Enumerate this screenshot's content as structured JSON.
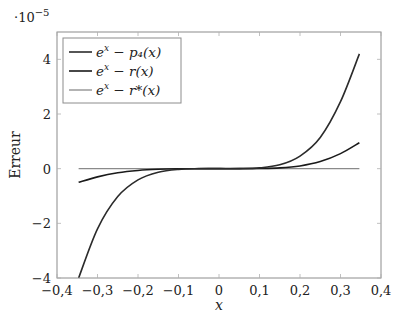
{
  "chart_data": {
    "type": "line",
    "title": "",
    "xlabel": "x",
    "ylabel": "Erreur",
    "y_scale_annotation": "·10^−5",
    "xlim": [
      -0.4,
      0.4
    ],
    "ylim": [
      -4,
      5
    ],
    "x_ticks": [
      -0.4,
      -0.3,
      -0.2,
      -0.1,
      0,
      0.1,
      0.2,
      0.3,
      0.4
    ],
    "x_tick_labels": [
      "−0,4",
      "−0,3",
      "−0,2",
      "−0,1",
      "0",
      "0,1",
      "0,2",
      "0,3",
      "0,4"
    ],
    "y_ticks": [
      -4,
      -2,
      0,
      2,
      4
    ],
    "y_tick_labels": [
      "−4",
      "−2",
      "0",
      "2",
      "4"
    ],
    "grid": false,
    "legend_position": "upper left",
    "series": [
      {
        "name": "e^x − p4(x)",
        "color": "#2b2b2b",
        "x": [
          -0.3466,
          -0.3,
          -0.25,
          -0.2,
          -0.15,
          -0.1,
          -0.05,
          0,
          0.05,
          0.1,
          0.15,
          0.2,
          0.25,
          0.3,
          0.3466
        ],
        "values": [
          -4.0,
          -2.2,
          -1.02,
          -0.41,
          -0.13,
          -0.026,
          -0.0017,
          0,
          0.0017,
          0.028,
          0.14,
          0.46,
          1.14,
          2.45,
          4.2
        ]
      },
      {
        "name": "e^x − r(x)",
        "color": "#1a1a1a",
        "x": [
          -0.3466,
          -0.3,
          -0.25,
          -0.2,
          -0.15,
          -0.1,
          -0.05,
          0,
          0.05,
          0.1,
          0.15,
          0.2,
          0.25,
          0.3,
          0.3466
        ],
        "values": [
          -0.5,
          -0.3,
          -0.15,
          -0.065,
          -0.022,
          -0.0045,
          -0.0003,
          0,
          0.0003,
          0.0055,
          0.028,
          0.1,
          0.26,
          0.55,
          0.95
        ]
      },
      {
        "name": "e^x − r*(x)",
        "color": "#8a8a8a",
        "x": [
          -0.3466,
          0.3466
        ],
        "values": [
          0,
          0
        ]
      }
    ]
  },
  "legend": {
    "items": [
      {
        "label_base": "e",
        "label_sup": "x",
        "label_rest": " − p₄(x)"
      },
      {
        "label_base": "e",
        "label_sup": "x",
        "label_rest": " − r(x)"
      },
      {
        "label_base": "e",
        "label_sup": "x",
        "label_rest": " − r*(x)"
      }
    ]
  }
}
